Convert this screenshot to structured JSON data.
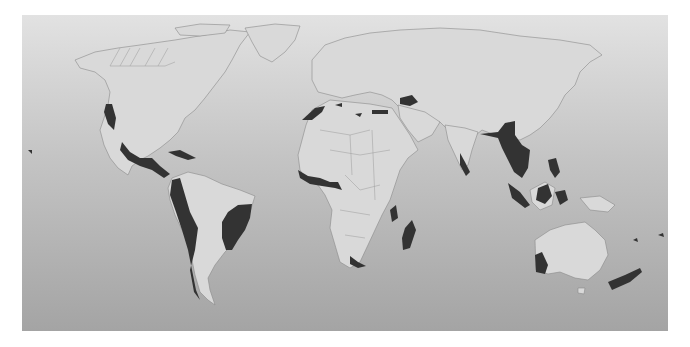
{
  "map": {
    "type": "world-map",
    "projection": "equirectangular",
    "colors": {
      "background_top": "#e2e2e2",
      "background_bottom": "#a4a4a4",
      "land": "#d9d9d9",
      "border": "#8a8a8a",
      "hotspot": "#333333"
    },
    "highlighted_regions": [
      "California Floristic Province",
      "Mesoamerica",
      "Caribbean Islands",
      "Tropical Andes",
      "Tumbes-Choco-Magdalena",
      "Chilean Winter Rainfall-Valdivian Forests",
      "Atlantic Forest",
      "Cerrado",
      "Mediterranean Basin",
      "Caucasus",
      "Guinean Forests of West Africa",
      "Coastal Forests of Eastern Africa",
      "Madagascar and Indian Ocean Islands",
      "Cape Floristic Region",
      "Succulent Karoo",
      "Western Ghats and Sri Lanka",
      "Indo-Burma",
      "Mountains of Southwest China",
      "Sundaland",
      "Wallacea",
      "Philippines",
      "Southwest Australia",
      "New Zealand",
      "New Caledonia",
      "Polynesia-Micronesia"
    ]
  }
}
